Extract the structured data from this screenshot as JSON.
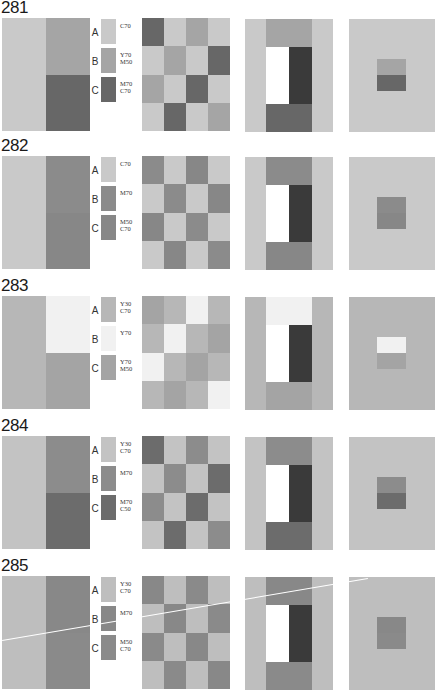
{
  "figures": [
    {
      "number": "281",
      "top": 0,
      "colors": {
        "A": "#c9c9c9",
        "B": "#a5a5a5",
        "C": "#676767"
      },
      "labels": [
        {
          "letter": "A",
          "code": "C70"
        },
        {
          "letter": "B",
          "code": "Y70\nM50"
        },
        {
          "letter": "C",
          "code": "M70\nC70"
        }
      ],
      "left_split": "BC",
      "checker": [
        "C",
        "A",
        "B",
        "A",
        "A",
        "B",
        "A",
        "C",
        "B",
        "A",
        "C",
        "A",
        "A",
        "C",
        "A",
        "B"
      ],
      "square_bottom": "C"
    },
    {
      "number": "282",
      "top": 138,
      "colors": {
        "A": "#c9c9c9",
        "B": "#8b8b8b",
        "C": "#878787"
      },
      "labels": [
        {
          "letter": "A",
          "code": "C70"
        },
        {
          "letter": "B",
          "code": "M70"
        },
        {
          "letter": "C",
          "code": "M50\nC70"
        }
      ],
      "left_split": "BC",
      "checker": [
        "B",
        "A",
        "C",
        "A",
        "A",
        "B",
        "A",
        "C",
        "C",
        "A",
        "B",
        "A",
        "A",
        "C",
        "A",
        "B"
      ],
      "square_bottom": "C"
    },
    {
      "number": "283",
      "top": 278,
      "colors": {
        "A": "#b7b7b7",
        "B": "#f1f1f1",
        "C": "#a4a4a4"
      },
      "labels": [
        {
          "letter": "A",
          "code": "Y30\nC70"
        },
        {
          "letter": "B",
          "code": "Y70"
        },
        {
          "letter": "C",
          "code": "Y70\nM50"
        }
      ],
      "left_split": "BC",
      "checker": [
        "C",
        "A",
        "B",
        "A",
        "A",
        "B",
        "A",
        "C",
        "B",
        "A",
        "C",
        "A",
        "A",
        "C",
        "A",
        "B"
      ],
      "square_bottom": "C"
    },
    {
      "number": "284",
      "top": 418,
      "colors": {
        "A": "#c3c3c3",
        "B": "#8c8c8c",
        "C": "#6c6c6c"
      },
      "labels": [
        {
          "letter": "A",
          "code": "Y30\nC70"
        },
        {
          "letter": "B",
          "code": "M70"
        },
        {
          "letter": "C",
          "code": "M70\nC50"
        }
      ],
      "left_split": "BC",
      "checker": [
        "C",
        "A",
        "B",
        "A",
        "A",
        "B",
        "A",
        "C",
        "B",
        "A",
        "C",
        "A",
        "A",
        "C",
        "A",
        "B"
      ],
      "square_bottom": "C"
    },
    {
      "number": "285",
      "top": 558,
      "colors": {
        "A": "#bebebe",
        "B": "#888888",
        "C": "#8a8a8a"
      },
      "labels": [
        {
          "letter": "A",
          "code": "Y30\nC70"
        },
        {
          "letter": "B",
          "code": "M70"
        },
        {
          "letter": "C",
          "code": "M50\nC70"
        }
      ],
      "left_split": "BC",
      "checker": [
        "B",
        "A",
        "C",
        "A",
        "A",
        "B",
        "A",
        "C",
        "C",
        "A",
        "B",
        "A",
        "A",
        "C",
        "A",
        "B"
      ],
      "square_bottom": "C"
    }
  ],
  "scratch": {
    "x1": 2,
    "y1": 640,
    "x2": 368,
    "y2": 578,
    "color": "#ffffff"
  }
}
